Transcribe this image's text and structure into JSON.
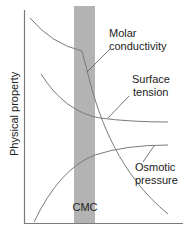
{
  "diagram": {
    "title": "",
    "y_axis_label": "Physical property",
    "band_label": "CMC",
    "curves": [
      {
        "name": "Molar conductivity",
        "label_line1": "Molar",
        "label_line2": "conductivity"
      },
      {
        "name": "Surface tension",
        "label_line1": "Surface",
        "label_line2": "tension"
      },
      {
        "name": "Osmotic pressure",
        "label_line1": "Osmotic",
        "label_line2": "pressure"
      }
    ],
    "colors": {
      "band": "#b3b3b3",
      "curve": "#7a7a7a",
      "axis": "#7a7a7a",
      "text": "#222222"
    }
  }
}
